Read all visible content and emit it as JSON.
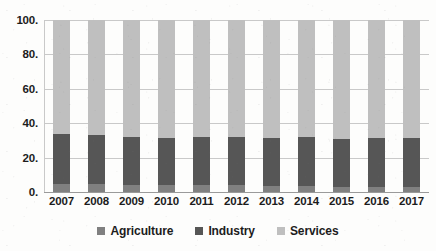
{
  "chart_data": {
    "type": "bar",
    "subtype": "100% stacked column",
    "title": "",
    "xlabel": "",
    "ylabel": "",
    "ylim": [
      0,
      100
    ],
    "yticks": [
      0,
      20,
      40,
      60,
      80,
      100
    ],
    "ytick_labels": [
      "0.",
      "20.",
      "40.",
      "60.",
      "80.",
      "100."
    ],
    "grid": true,
    "legend_position": "bottom",
    "categories": [
      "2007",
      "2008",
      "2009",
      "2010",
      "2011",
      "2012",
      "2013",
      "2014",
      "2015",
      "2016",
      "2017"
    ],
    "series": [
      {
        "name": "Agriculture",
        "color": "#808080",
        "values": [
          4.5,
          4.5,
          4.0,
          4.0,
          3.8,
          3.8,
          3.5,
          3.5,
          3.2,
          3.2,
          3.0
        ]
      },
      {
        "name": "Industry",
        "color": "#565656",
        "values": [
          29.0,
          28.5,
          28.0,
          27.5,
          28.2,
          28.0,
          27.8,
          28.3,
          27.8,
          28.0,
          28.5
        ]
      },
      {
        "name": "Services",
        "color": "#bfbfbf",
        "values": [
          66.5,
          67.0,
          68.0,
          68.5,
          68.0,
          68.2,
          68.7,
          68.2,
          69.0,
          68.8,
          68.5
        ]
      }
    ],
    "series_totals": [
      100,
      100,
      100,
      100,
      100,
      100,
      100,
      100,
      100,
      100,
      100
    ]
  },
  "axes": {
    "y_ticks": [
      {
        "label": "100.",
        "value": 100
      },
      {
        "label": "80.",
        "value": 80
      },
      {
        "label": "60.",
        "value": 60
      },
      {
        "label": "40.",
        "value": 40
      },
      {
        "label": "20.",
        "value": 20
      },
      {
        "label": "0.",
        "value": 0
      }
    ],
    "x_ticks": [
      "2007",
      "2008",
      "2009",
      "2010",
      "2011",
      "2012",
      "2013",
      "2014",
      "2015",
      "2016",
      "2017"
    ]
  },
  "legend": {
    "items": [
      {
        "label": "Agriculture",
        "color": "#808080"
      },
      {
        "label": "Industry",
        "color": "#565656"
      },
      {
        "label": "Services",
        "color": "#bfbfbf"
      }
    ]
  },
  "colors": {
    "agriculture": "#808080",
    "industry": "#565656",
    "services": "#bfbfbf",
    "gridline": "#c9c9c9",
    "text": "#1c1c1c",
    "background": "#fdfdfc"
  }
}
